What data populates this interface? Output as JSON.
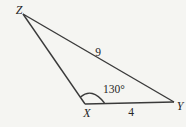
{
  "figure": {
    "vertices": {
      "z": {
        "label": "Z"
      },
      "x": {
        "label": "X"
      },
      "y": {
        "label": "Y"
      }
    },
    "side_labels": {
      "zy": "9",
      "xy": "4"
    },
    "angle_labels": {
      "x": "130°"
    },
    "geometry_values": {
      "angle_at_x_degrees": 130,
      "side_zy_length": 9,
      "side_xy_length": 4
    },
    "colors": {
      "line": "#3a3a3a",
      "text": "#262626",
      "background": "#f5f5f2"
    }
  }
}
